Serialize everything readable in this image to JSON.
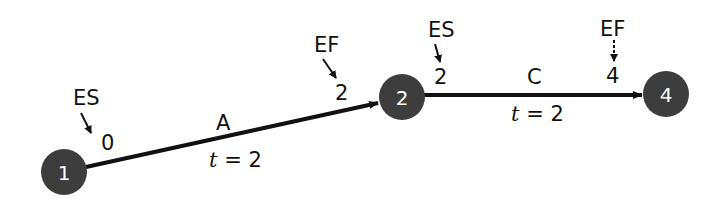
{
  "diagram": {
    "type": "activity-on-arrow network",
    "nodes": [
      {
        "id": "1",
        "label": "1"
      },
      {
        "id": "2",
        "label": "2"
      },
      {
        "id": "4",
        "label": "4"
      }
    ],
    "activities": [
      {
        "name": "A",
        "from": "1",
        "to": "2",
        "duration_label": "t = 2",
        "t_var": "t",
        "t_rest": " = 2",
        "es_tag": "ES",
        "es_value": "0",
        "ef_tag": "EF",
        "ef_value": "2"
      },
      {
        "name": "C",
        "from": "2",
        "to": "4",
        "duration_label": "t = 2",
        "t_var": "t",
        "t_rest": " = 2",
        "es_tag": "ES",
        "es_value": "2",
        "ef_tag": "EF",
        "ef_value": "4"
      }
    ],
    "colors": {
      "node_fill": "#3d3d3d",
      "node_text": "#ffffff",
      "edge": "#111111"
    }
  }
}
